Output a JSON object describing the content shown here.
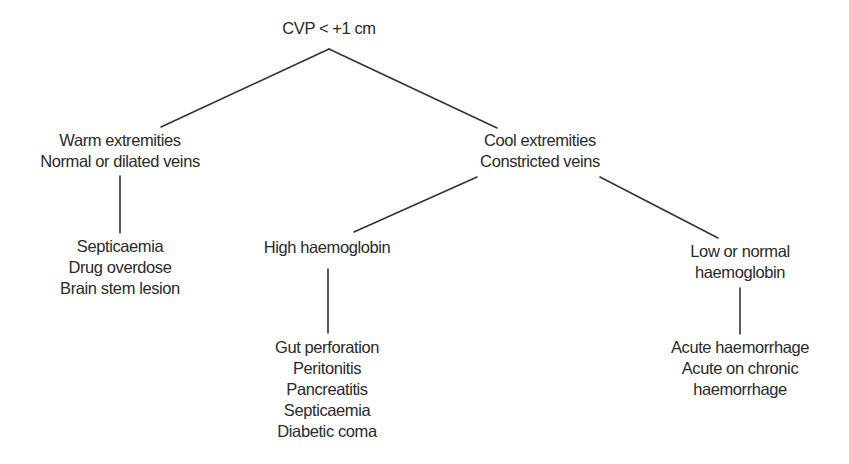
{
  "diagram": {
    "type": "decision-tree",
    "line_color": "#333333",
    "text_color": "#2a2a2a",
    "root": {
      "id": "root",
      "lines": [
        "CVP < +1 cm"
      ]
    },
    "nodes": {
      "warm": {
        "lines": [
          "Warm extremities",
          "Normal or dilated veins"
        ]
      },
      "warm_causes": {
        "lines": [
          "Septicaemia",
          "Drug overdose",
          "Brain stem lesion"
        ]
      },
      "cool": {
        "lines": [
          "Cool extremities",
          "Constricted veins"
        ]
      },
      "high_hb": {
        "lines": [
          "High haemoglobin"
        ]
      },
      "high_hb_causes": {
        "lines": [
          "Gut perforation",
          "Peritonitis",
          "Pancreatitis",
          "Septicaemia",
          "Diabetic coma"
        ]
      },
      "low_hb": {
        "lines": [
          "Low or normal",
          "haemoglobin"
        ]
      },
      "low_hb_causes": {
        "lines": [
          "Acute haemorrhage",
          "Acute on chronic",
          "haemorrhage"
        ]
      }
    },
    "edges": [
      {
        "from": "root",
        "to": "warm"
      },
      {
        "from": "root",
        "to": "cool"
      },
      {
        "from": "warm",
        "to": "warm_causes"
      },
      {
        "from": "cool",
        "to": "high_hb"
      },
      {
        "from": "cool",
        "to": "low_hb"
      },
      {
        "from": "high_hb",
        "to": "high_hb_causes"
      },
      {
        "from": "low_hb",
        "to": "low_hb_causes"
      }
    ]
  }
}
